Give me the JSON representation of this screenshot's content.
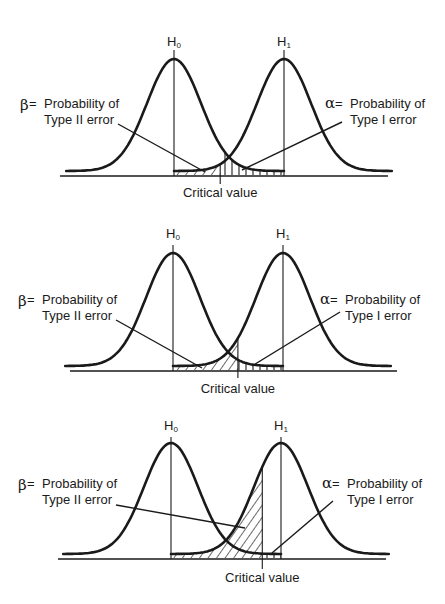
{
  "chart_data": {
    "type": "diagram",
    "distribution": "normal",
    "h0_mean": 0,
    "h1_mean": 1,
    "sigma": 0.245,
    "panels": [
      {
        "id": "panel-1",
        "critical_value": 0.42,
        "h0_label": "H",
        "h0_sub": "0",
        "h1_label": "H",
        "h1_sub": "1",
        "beta_label": {
          "symbol": "β",
          "eq": "=",
          "line1": "Probability of",
          "line2": "Type II error"
        },
        "alpha_label": {
          "symbol": "α",
          "eq": "=",
          "line1": "Probability of",
          "line2": "Type I error"
        },
        "critical_label": "Critical value",
        "beta_hatch": "diagonal",
        "alpha_hatch": "vertical"
      },
      {
        "id": "panel-2",
        "critical_value": 0.59,
        "h0_label": "H",
        "h0_sub": "0",
        "h1_label": "H",
        "h1_sub": "1",
        "beta_label": {
          "symbol": "β",
          "eq": "=",
          "line1": "Probability of",
          "line2": "Type II error"
        },
        "alpha_label": {
          "symbol": "α",
          "eq": "=",
          "line1": "Probability of",
          "line2": "Type I error"
        },
        "critical_label": "Critical value",
        "beta_hatch": "diagonal",
        "alpha_hatch": "vertical"
      },
      {
        "id": "panel-3",
        "critical_value": 0.83,
        "h0_label": "H",
        "h0_sub": "0",
        "h1_label": "H",
        "h1_sub": "1",
        "beta_label": {
          "symbol": "β",
          "eq": "=",
          "line1": "Probability of",
          "line2": "Type II error"
        },
        "alpha_label": {
          "symbol": "α",
          "eq": "=",
          "line1": "Probability of",
          "line2": "Type I error"
        },
        "critical_label": "Critical value",
        "beta_hatch": "diagonal",
        "alpha_hatch": "vertical"
      }
    ]
  },
  "colors": {
    "ink": "#1a1a1a",
    "background": "#ffffff"
  }
}
